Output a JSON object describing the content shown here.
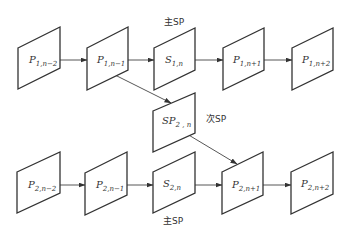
{
  "diagram": {
    "type": "frame-dependency-diagram",
    "rows": [
      {
        "name": "row-1",
        "nodes": [
          {
            "id": "P1n-2",
            "main": "P",
            "sub": "1,n−2"
          },
          {
            "id": "P1n-1",
            "main": "P",
            "sub": "1,n−1"
          },
          {
            "id": "S1n",
            "main": "S",
            "sub": "1,n"
          },
          {
            "id": "P1n+1",
            "main": "P",
            "sub": "1,n+1"
          },
          {
            "id": "P1n+2",
            "main": "P",
            "sub": "1,n+2"
          }
        ]
      },
      {
        "name": "middle",
        "nodes": [
          {
            "id": "SP2n",
            "main": "SP",
            "sub": "2 , n"
          }
        ]
      },
      {
        "name": "row-2",
        "nodes": [
          {
            "id": "P2n-2",
            "main": "P",
            "sub": "2,n−2"
          },
          {
            "id": "P2n-1",
            "main": "P",
            "sub": "2,n−1"
          },
          {
            "id": "S2n",
            "main": "S",
            "sub": "2,n"
          },
          {
            "id": "P2n+1",
            "main": "P",
            "sub": "2,n+1"
          },
          {
            "id": "P2n+2",
            "main": "P",
            "sub": "2,n+2"
          }
        ]
      }
    ],
    "annotations": {
      "top_primary_sp": "主SP",
      "secondary_sp": "次SP",
      "bottom_primary_sp": "主SP"
    },
    "edges": [
      {
        "from": "P1n-2",
        "to": "P1n-1"
      },
      {
        "from": "P1n-1",
        "to": "S1n"
      },
      {
        "from": "S1n",
        "to": "P1n+1"
      },
      {
        "from": "P1n+1",
        "to": "P1n+2"
      },
      {
        "from": "P1n-1",
        "to": "SP2n"
      },
      {
        "from": "SP2n",
        "to": "P2n+1"
      },
      {
        "from": "P2n-2",
        "to": "P2n-1"
      },
      {
        "from": "P2n-1",
        "to": "S2n"
      },
      {
        "from": "S2n",
        "to": "P2n+1"
      },
      {
        "from": "P2n+1",
        "to": "P2n+2"
      }
    ],
    "colors": {
      "stroke": "#333333",
      "background": "#ffffff"
    }
  }
}
